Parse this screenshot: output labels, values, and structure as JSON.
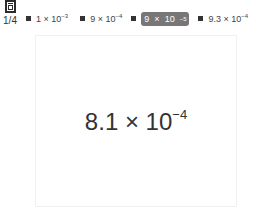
{
  "pager": {
    "icon": "card-stack-icon",
    "label": "1/4"
  },
  "options": [
    {
      "mantissa": "1",
      "times": "×",
      "base": "10",
      "exp": "−3",
      "selected": false
    },
    {
      "mantissa": "9",
      "times": "×",
      "base": "10",
      "exp": "−4",
      "selected": false
    },
    {
      "mantissa": "9",
      "times": "×",
      "base": "10",
      "exp": "−5",
      "selected": true
    },
    {
      "mantissa": "9.3",
      "times": "×",
      "base": "10",
      "exp": "−4",
      "selected": false
    }
  ],
  "card": {
    "mantissa": "8.1",
    "times": "×",
    "base": "10",
    "exp": "−4"
  },
  "colors": {
    "selected_bg": "#777777",
    "text": "#333333"
  }
}
